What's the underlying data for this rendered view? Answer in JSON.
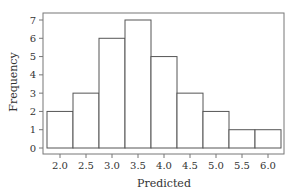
{
  "chart_data": {
    "type": "bar",
    "subtype": "histogram",
    "title": "",
    "xlabel": "Predicted",
    "ylabel": "Frequency",
    "bin_edges": [
      1.75,
      2.25,
      2.75,
      3.25,
      3.75,
      4.25,
      4.75,
      5.25,
      5.75,
      6.25
    ],
    "categories": [
      "2.0",
      "2.5",
      "3.0",
      "3.5",
      "4.0",
      "4.5",
      "5.0",
      "5.5",
      "6.0"
    ],
    "values": [
      2,
      3,
      6,
      7,
      5,
      3,
      2,
      1,
      1
    ],
    "x_ticks": [
      "2.0",
      "2.5",
      "3.0",
      "3.5",
      "4.0",
      "4.5",
      "5.0",
      "5.5",
      "6.0"
    ],
    "y_ticks": [
      "0",
      "1",
      "2",
      "3",
      "4",
      "5",
      "6",
      "7"
    ],
    "ylim": [
      0,
      7
    ],
    "grid": false,
    "legend": null,
    "colors": {
      "bar_fill": "#ffffff",
      "bar_stroke": "#555555",
      "frame": "#777777"
    }
  }
}
